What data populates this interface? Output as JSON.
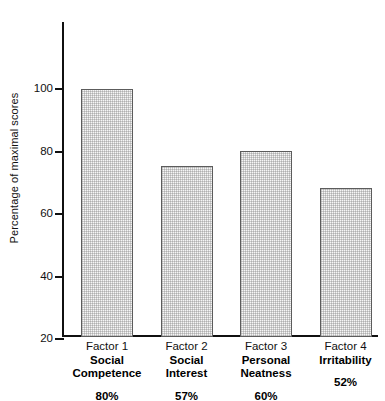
{
  "chart_data": {
    "type": "bar",
    "title": "",
    "xlabel": "",
    "ylabel": "Percentage of maximal scores",
    "ylim": [
      0,
      100
    ],
    "yticks": [
      20,
      40,
      60,
      80,
      100
    ],
    "ytick_labels": [
      "20",
      "40",
      "60",
      "80",
      "100"
    ],
    "grid": false,
    "legend": null,
    "categories": [
      "Factor 1 Social Competence",
      "Factor 2 Social Interest",
      "Factor 3 Personal Neatness",
      "Factor 4 Irritability"
    ],
    "values": [
      80,
      55,
      60,
      48
    ],
    "data_labels": [
      "80%",
      "57%",
      "60%",
      "52%"
    ],
    "bars": [
      {
        "factor": "Factor 1",
        "name_line1": "Social",
        "name_line2": "Competence",
        "value": 80,
        "percent_label": "80%"
      },
      {
        "factor": "Factor 2",
        "name_line1": "Social",
        "name_line2": "Interest",
        "value": 55,
        "percent_label": "57%"
      },
      {
        "factor": "Factor 3",
        "name_line1": "Personal",
        "name_line2": "Neatness",
        "value": 60,
        "percent_label": "60%"
      },
      {
        "factor": "Factor 4",
        "name_line1": "Irritability",
        "name_line2": "",
        "value": 48,
        "percent_label": "52%"
      }
    ],
    "colors": {
      "bar_fill": "#e6e6e6",
      "bar_border": "#5c5c5c",
      "axis": "#101010",
      "text": "#111111",
      "background": "#ffffff"
    }
  }
}
